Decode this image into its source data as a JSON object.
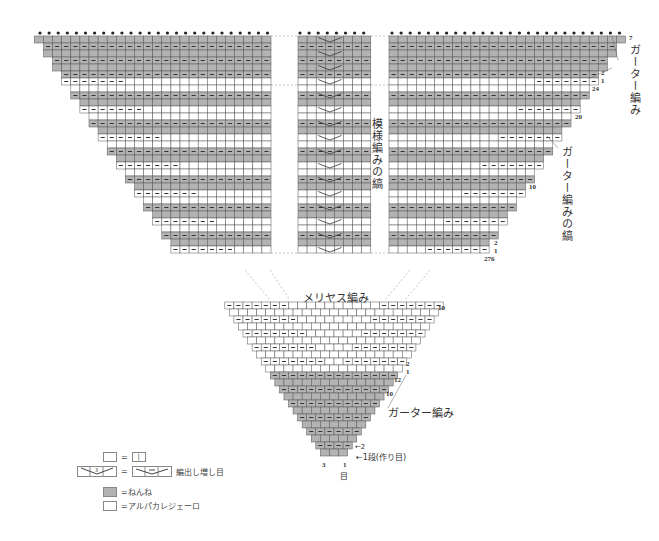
{
  "colors": {
    "gray_fill": "#b3b3b3",
    "white_fill": "#ffffff",
    "grid_line": "#555555",
    "purl_mark": "#333333"
  },
  "labels": {
    "garter_top": "ガーター編み",
    "pattern_stripe": "模様編みの縞",
    "garter_stripe": "ガーター編みの縞",
    "stockinette": "メリヤス編み",
    "garter_bottom": "ガーター編み",
    "row_one": "←1段(作り目)",
    "row_two": "←2",
    "stitch_3": "3",
    "stitch_1": "1",
    "stitch_unit": "目"
  },
  "row_numbers": {
    "top_7": "7",
    "top_2": "2",
    "top_1": "1",
    "r24": "24",
    "r20": "20",
    "r10_upper": "10",
    "mid_2": "2",
    "mid_1": "1",
    "r276": "276",
    "lower_10": "10",
    "lower_2": "2",
    "lower_1": "1",
    "r12": "12",
    "r10_bottom": "10"
  },
  "legend": {
    "knit_eq": "=",
    "knit_symbol": "|",
    "increase_symbol": "3",
    "increase_eq": "=",
    "increase_label": "編出し増し目",
    "gray_label": "=ねんね",
    "white_label": "=アルパカレジェーロ"
  },
  "chart_data": {
    "type": "knitting-chart",
    "title": "",
    "sections": [
      {
        "name": "upper-left-wing",
        "rows": 27,
        "fill_pattern": "garter-stripes-gray"
      },
      {
        "name": "center-panel",
        "stitches": 8,
        "symbol": "3-stitch increase"
      },
      {
        "name": "upper-right-wing",
        "rows": 27,
        "fill_pattern": "garter-stripes-gray"
      },
      {
        "name": "lower-triangle",
        "rows_labeled": [
          1,
          2,
          10,
          12
        ],
        "fill_pattern": "gray-base-white-top"
      }
    ],
    "annotations": [
      "ガーター編み",
      "模様編みの縞",
      "ガーター編みの縞",
      "メリヤス編み",
      "ガーター編み",
      "1段(作り目)"
    ],
    "row_labels_right": [
      7,
      2,
      1,
      24,
      20,
      10,
      2,
      1,
      276,
      10,
      2,
      1,
      12,
      10,
      2,
      1
    ],
    "stitch_labels_bottom": [
      3,
      1
    ]
  }
}
